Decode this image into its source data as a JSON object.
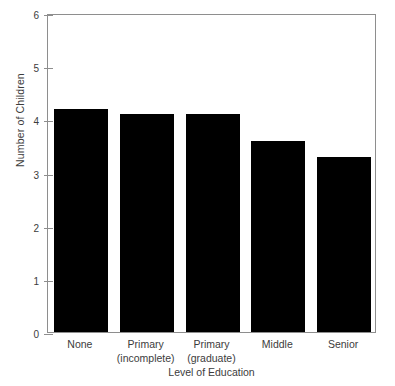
{
  "chart_data": {
    "type": "bar",
    "title": "",
    "subtitle": "",
    "xlabel": "Level of Education",
    "ylabel": "Number of Children",
    "categories": [
      "None",
      "Primary (incomplete)",
      "Primary (graduate)",
      "Middle",
      "Senior"
    ],
    "category_lines": [
      [
        "None"
      ],
      [
        "Primary",
        "(incomplete)"
      ],
      [
        "Primary",
        "(graduate)"
      ],
      [
        "Middle"
      ],
      [
        "Senior"
      ]
    ],
    "values": [
      4.2,
      4.1,
      4.1,
      3.6,
      3.3
    ],
    "ylim": [
      0,
      6
    ],
    "ytick_labels": [
      "0",
      "1",
      "2",
      "3",
      "4",
      "5",
      "6"
    ],
    "ytick_values": [
      0,
      1,
      2,
      3,
      4,
      5,
      6
    ],
    "grid": false,
    "legend": false,
    "legend_position": "none",
    "bar_color": "#000000",
    "axis_color": "#8e8e8e",
    "text_color": "#3c3c3c",
    "background_color": "#ffffff"
  }
}
